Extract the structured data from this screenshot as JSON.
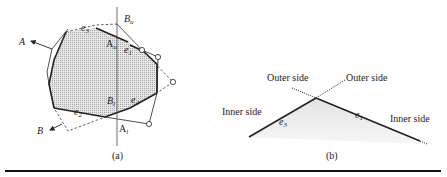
{
  "figure_a": {
    "caption": "(a)",
    "labels": {
      "A": "A",
      "B": "B",
      "Bu_main": "B",
      "Bu_sub": "u",
      "Au_main": "A",
      "Au_sub": "u",
      "Bl_main": "B",
      "Bl_sub": "l",
      "Al_main": "A",
      "Al_sub": "l",
      "e1_main": "e",
      "e1_sub": "1",
      "e2_main": "e",
      "e2_sub": "2",
      "e3_main": "e",
      "e3_sub": "3",
      "e4_main": "e",
      "e4_sub": "4"
    }
  },
  "figure_b": {
    "caption": "(b)",
    "outer_left": "Outer side",
    "outer_right": "Outer side",
    "inner_left": "Inner side",
    "inner_right": "Inner side",
    "e3_main": "e",
    "e3_sub": "3",
    "e1_main": "e",
    "e1_sub": "1"
  },
  "colors": {
    "ink": "#222222",
    "fill": "#d8d8d8",
    "fill_light": "#ececec"
  }
}
